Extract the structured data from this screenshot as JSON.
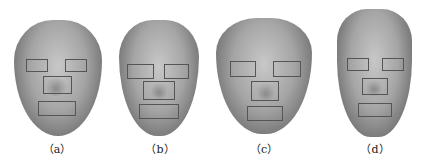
{
  "figure": {
    "panels": [
      {
        "id": "a",
        "caption": "（a）"
      },
      {
        "id": "b",
        "caption": "（b）"
      },
      {
        "id": "c",
        "caption": "（c）"
      },
      {
        "id": "d",
        "caption": "（d）"
      }
    ]
  }
}
